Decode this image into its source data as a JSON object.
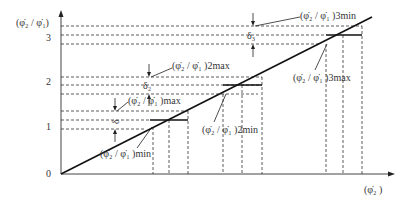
{
  "diagram": {
    "y_axis_label": "(φ̇₂ / φ̇₁)",
    "x_axis_label": "(φ̇₂ )",
    "y_ticks": [
      {
        "label": "0",
        "y": 174
      },
      {
        "label": "1",
        "y": 127
      },
      {
        "label": "2",
        "y": 82
      },
      {
        "label": "3",
        "y": 38
      }
    ],
    "annotations": {
      "max1": "(φ̇₂ / φ̇₁ )max",
      "min1": "(φ̇₂ / φ̇₁ )min",
      "max2": "(φ̇₂ / φ̇₁ )2max",
      "min2": "(φ̇₂ / φ̇₁ )2min",
      "min3": "(φ̇₂ / φ̇₁ )3min",
      "max3": "(φ̇₂ / φ̇₁ )3max",
      "delta1": "δ",
      "delta2": "δ₂",
      "delta3": "δ₃"
    },
    "colors": {
      "line": "#111111",
      "dashed": "#333333",
      "background": "#ffffff"
    }
  }
}
